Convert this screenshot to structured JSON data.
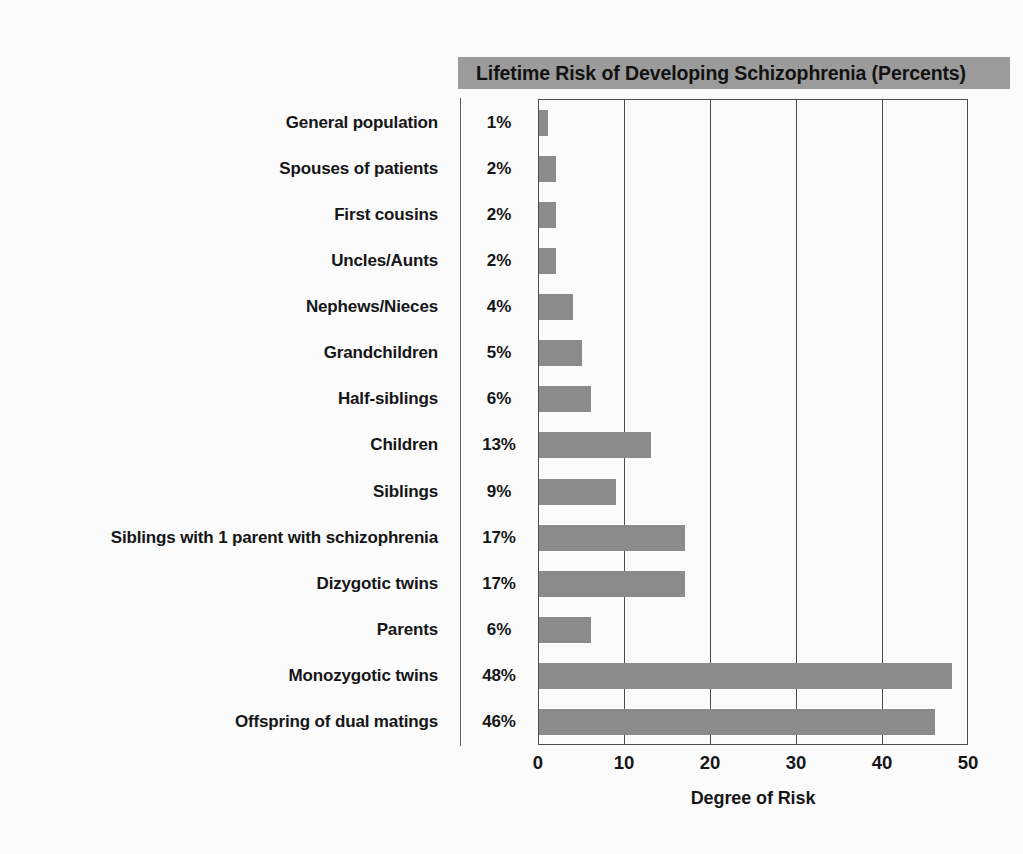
{
  "chart_data": {
    "type": "bar",
    "orientation": "horizontal",
    "title": "Lifetime Risk of Developing Schizophrenia (Percents)",
    "xlabel": "Degree of Risk",
    "ylabel": "",
    "xlim": [
      0,
      50
    ],
    "xticks": [
      0,
      10,
      20,
      30,
      40,
      50
    ],
    "xtick_labels": [
      "0",
      "10",
      "20",
      "30",
      "40",
      "50"
    ],
    "gridlines": [
      10,
      20,
      30,
      40
    ],
    "grid": true,
    "legend": null,
    "bar_color": "#8b8b8b",
    "title_band_color": "#9b9b9b",
    "axis_color": "#4a4c4e",
    "background_color": "#fbfbfb",
    "categories": [
      "General population",
      "Spouses of patients",
      "First cousins",
      "Uncles/Aunts",
      "Nephews/Nieces",
      "Grandchildren",
      "Half-siblings",
      "Children",
      "Siblings",
      "Siblings with 1 parent with schizophrenia",
      "Dizygotic twins",
      "Parents",
      "Monozygotic twins",
      "Offspring of dual matings"
    ],
    "values": [
      1,
      2,
      2,
      2,
      4,
      5,
      6,
      13,
      9,
      17,
      17,
      6,
      48,
      46
    ],
    "value_labels": [
      "1%",
      "2%",
      "2%",
      "2%",
      "4%",
      "5%",
      "6%",
      "13%",
      "9%",
      "17%",
      "17%",
      "6%",
      "48%",
      "46%"
    ]
  },
  "rows": [
    {
      "label": "General population",
      "pct": "1%",
      "value": 1
    },
    {
      "label": "Spouses of patients",
      "pct": "2%",
      "value": 2
    },
    {
      "label": "First cousins",
      "pct": "2%",
      "value": 2
    },
    {
      "label": "Uncles/Aunts",
      "pct": "2%",
      "value": 2
    },
    {
      "label": "Nephews/Nieces",
      "pct": "4%",
      "value": 4
    },
    {
      "label": "Grandchildren",
      "pct": "5%",
      "value": 5
    },
    {
      "label": "Half-siblings",
      "pct": "6%",
      "value": 6
    },
    {
      "label": "Children",
      "pct": "13%",
      "value": 13
    },
    {
      "label": "Siblings",
      "pct": "9%",
      "value": 9
    },
    {
      "label": "Siblings with 1 parent with schizophrenia",
      "pct": "17%",
      "value": 17
    },
    {
      "label": "Dizygotic twins",
      "pct": "17%",
      "value": 17
    },
    {
      "label": "Parents",
      "pct": "6%",
      "value": 6
    },
    {
      "label": "Monozygotic twins",
      "pct": "48%",
      "value": 48
    },
    {
      "label": "Offspring of dual matings",
      "pct": "46%",
      "value": 46
    }
  ],
  "axis": {
    "ticks": [
      "0",
      "10",
      "20",
      "30",
      "40",
      "50"
    ],
    "label": "Degree of Risk"
  },
  "title": {
    "text": "Lifetime Risk of Developing Schizophrenia (Percents)"
  }
}
